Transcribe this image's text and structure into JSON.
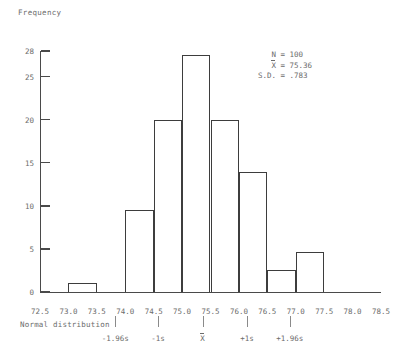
{
  "chart_data": {
    "type": "bar",
    "title": "",
    "xlabel": "Normal distribution",
    "ylabel": "Frequency",
    "xlim": [
      72.5,
      78.5
    ],
    "ylim": [
      0,
      28
    ],
    "grid": false,
    "bin_width": 0.5,
    "categories": [
      "72.5-73.0",
      "73.0-73.5",
      "73.5-74.0",
      "74.0-74.5",
      "74.5-75.0",
      "75.0-75.5",
      "75.5-76.0",
      "76.0-76.5",
      "76.5-77.0",
      "77.0-77.5",
      "77.5-78.0",
      "78.0-78.5"
    ],
    "bins": [
      {
        "start": 72.5,
        "end": 73.0,
        "value": 0
      },
      {
        "start": 73.0,
        "end": 73.5,
        "value": 1
      },
      {
        "start": 73.5,
        "end": 74.0,
        "value": 0
      },
      {
        "start": 74.0,
        "end": 74.5,
        "value": 9.5
      },
      {
        "start": 74.5,
        "end": 75.0,
        "value": 20
      },
      {
        "start": 75.0,
        "end": 75.5,
        "value": 27.5
      },
      {
        "start": 75.5,
        "end": 76.0,
        "value": 20
      },
      {
        "start": 76.0,
        "end": 76.5,
        "value": 14
      },
      {
        "start": 76.5,
        "end": 77.0,
        "value": 2.5
      },
      {
        "start": 77.0,
        "end": 77.5,
        "value": 4.7
      },
      {
        "start": 77.5,
        "end": 78.0,
        "value": 0
      },
      {
        "start": 78.0,
        "end": 78.5,
        "value": 0
      }
    ],
    "values": [
      0,
      1,
      0,
      9.5,
      20,
      27.5,
      20,
      14,
      2.5,
      4.7,
      0,
      0
    ],
    "yticks": [
      0,
      5,
      10,
      15,
      20,
      25,
      28
    ],
    "ytick_labels": [
      "0",
      "5",
      "10",
      "15",
      "20",
      "25",
      "28"
    ],
    "xticks": [
      72.5,
      73.0,
      73.5,
      74.0,
      74.5,
      75.0,
      75.5,
      76.0,
      76.5,
      77.0,
      77.5,
      78.0,
      78.5
    ],
    "xtick_labels": [
      "72.5",
      "73.0",
      "73.5",
      "74.0",
      "74.5",
      "75.0",
      "75.5",
      "76.0",
      "76.5",
      "77.0",
      "77.5",
      "78.0",
      "78.5"
    ],
    "annotations": {
      "n_label": "N",
      "n_value": "= 100",
      "mean_label": "X",
      "mean_value": "= 75.36",
      "sd_label": "S.D.",
      "sd_value": "= .783"
    },
    "sd_markers": [
      {
        "label": "-1.96s",
        "x": 73.825
      },
      {
        "label": "-1s",
        "x": 74.577
      },
      {
        "label": "X",
        "x": 75.36,
        "overbar": true
      },
      {
        "label": "+1s",
        "x": 76.143
      },
      {
        "label": "+1.96s",
        "x": 76.895
      }
    ]
  }
}
